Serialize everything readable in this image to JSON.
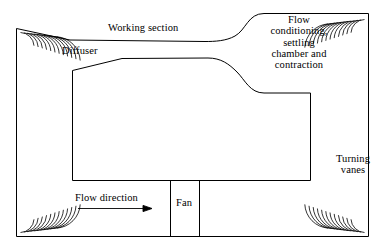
{
  "diagram": {
    "stroke_color": "#000000",
    "background_color": "#ffffff",
    "labels": {
      "working_section": "Working section",
      "diffuser": "Diffuser",
      "flow_conditioning": "Flow\nconditioning,\nsettling\nchamber and\ncontraction",
      "turning_vanes": "Turning\nvanes",
      "flow_direction": "Flow direction",
      "fan": "Fan"
    },
    "components": {
      "outer_circuit": "outer-tunnel-wall",
      "inner_circuit": "inner-tunnel-wall",
      "corner_vane_sets": 4,
      "fan_section": "fan-duct-segment",
      "flow_arrow_direction": "right"
    }
  }
}
